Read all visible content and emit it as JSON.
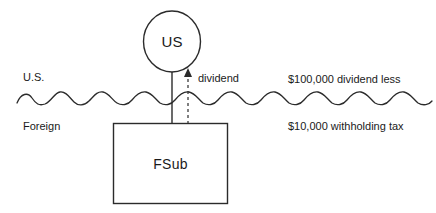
{
  "diagram": {
    "entities": {
      "parent": {
        "label": "US",
        "shape": "circle"
      },
      "subsidiary": {
        "label": "FSub",
        "shape": "rectangle"
      }
    },
    "flow": {
      "label": "dividend",
      "direction": "upward",
      "style": "dashed-arrow"
    },
    "border": {
      "style": "wavy-line",
      "above_label": "U.S.",
      "below_label": "Foreign"
    },
    "annotations": {
      "line1": "$100,000 dividend less",
      "line2": "$10,000 withholding tax"
    },
    "colors": {
      "stroke": "#2b2b2b",
      "text": "#1a1a1a",
      "background": "#ffffff"
    }
  }
}
